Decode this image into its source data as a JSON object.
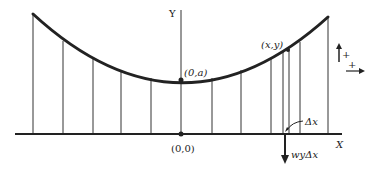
{
  "diagram": {
    "type": "catenary-cable-diagram",
    "axes": {
      "x_label": "X",
      "y_label": "Y",
      "origin_label": "(0,0)"
    },
    "curve": {
      "vertex_label": "(0,a)",
      "point_label": "(x,y)"
    },
    "annotations": {
      "element_width": "Δx",
      "load": "wyΔx"
    },
    "sign_convention": {
      "vertical_positive": "+",
      "horizontal_positive": "+"
    },
    "colors": {
      "ink": "#222222",
      "background": "#ffffff"
    }
  }
}
